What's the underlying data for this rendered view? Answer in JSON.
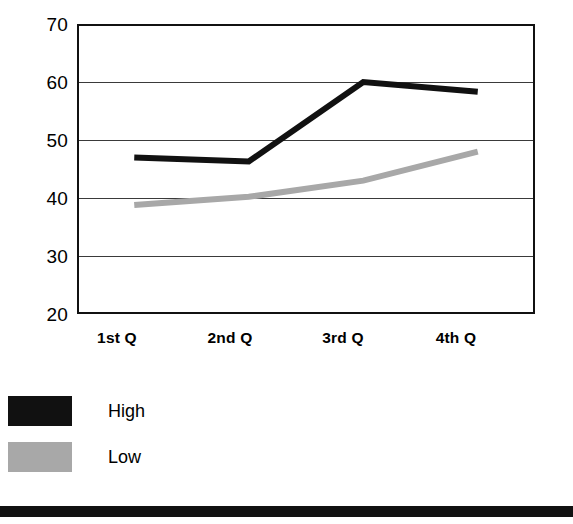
{
  "chart_data": {
    "type": "line",
    "title": "",
    "subtitle": "",
    "xlabel": "",
    "ylabel": "",
    "categories": [
      "1st Q",
      "2nd Q",
      "3rd Q",
      "4th Q"
    ],
    "series": [
      {
        "name": "High",
        "color": "#111111",
        "values": [
          47,
          46.3,
          60,
          58.3
        ]
      },
      {
        "name": "Low",
        "color": "#a8a8a8",
        "values": [
          38.8,
          40.2,
          43,
          48
        ]
      }
    ],
    "ylim": [
      20,
      70
    ],
    "yticks": [
      20,
      30,
      40,
      50,
      60,
      70
    ],
    "ytick_labels": [
      "20",
      "30",
      "40",
      "50",
      "60",
      "70"
    ],
    "grid": true,
    "grid_axis": "y",
    "legend_position": "bottom-left",
    "legend": [
      {
        "label": "High",
        "swatch": "black-swatch",
        "color": "#111111"
      },
      {
        "label": "Low",
        "swatch": "gray-swatch",
        "color": "#a8a8a8"
      }
    ]
  },
  "axes": {
    "y": {
      "t70": "70",
      "t60": "60",
      "t50": "50",
      "t40": "40",
      "t30": "30",
      "t20": "20"
    },
    "x": {
      "q1": "1st Q",
      "q2": "2nd Q",
      "q3": "3rd Q",
      "q4": "4th Q"
    }
  },
  "legend": {
    "high_label": "High",
    "low_label": "Low"
  },
  "colors": {
    "high": "#111111",
    "low": "#a8a8a8",
    "frame": "#111111",
    "grid": "#3a3a3a",
    "background": "#ffffff"
  }
}
